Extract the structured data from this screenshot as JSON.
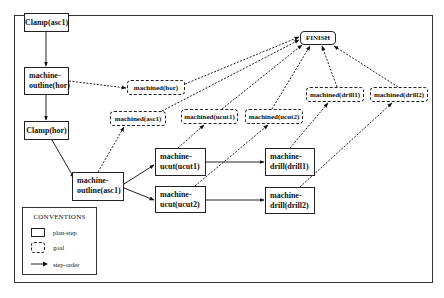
{
  "diagram": {
    "plan_steps": [
      {
        "id": "clamp_asc1",
        "label": "Clamp(asc1)"
      },
      {
        "id": "outline_hor",
        "label_line1": "machine-",
        "label_line2": "outline(hor)"
      },
      {
        "id": "clamp_hor",
        "label": "Clamp(hor)"
      },
      {
        "id": "outline_asc1",
        "label_line1": "machine-",
        "label_line2": "outline(asc1)"
      },
      {
        "id": "ucut1",
        "label_line1": "machine-",
        "label_line2": "ucut(ucut1)"
      },
      {
        "id": "ucut2",
        "label_line1": "machine-",
        "label_line2": "ucut(ucut2)"
      },
      {
        "id": "drill1",
        "label_line1": "machine-",
        "label_line2": "drill(drill1)"
      },
      {
        "id": "drill2",
        "label_line1": "machine-",
        "label_line2": "drill(drill2)"
      }
    ],
    "goals": [
      {
        "id": "g_hor",
        "label": "machined(hor)"
      },
      {
        "id": "g_asc1",
        "label": "machined(asc1)"
      },
      {
        "id": "g_ucut1",
        "label": "machined(ucut1)"
      },
      {
        "id": "g_ucut2",
        "label": "machined(ucut2)"
      },
      {
        "id": "g_drill1",
        "label": "machined(drill1)"
      },
      {
        "id": "g_drill2",
        "label": "machined(drill2)"
      }
    ],
    "finish": {
      "label": "FINISH"
    },
    "step_order_edges": [
      [
        "clamp_asc1",
        "outline_hor"
      ],
      [
        "outline_hor",
        "clamp_hor"
      ],
      [
        "clamp_hor",
        "outline_asc1"
      ],
      [
        "outline_asc1",
        "ucut1"
      ],
      [
        "outline_asc1",
        "ucut2"
      ],
      [
        "ucut1",
        "drill1"
      ],
      [
        "ucut2",
        "drill2"
      ]
    ],
    "goal_edges": [
      [
        "outline_hor",
        "g_hor"
      ],
      [
        "outline_asc1",
        "g_asc1"
      ],
      [
        "ucut1",
        "g_ucut1"
      ],
      [
        "ucut2",
        "g_ucut2"
      ],
      [
        "drill1",
        "g_drill1"
      ],
      [
        "drill2",
        "g_drill2"
      ],
      [
        "g_hor",
        "finish"
      ],
      [
        "g_asc1",
        "finish"
      ],
      [
        "g_ucut1",
        "finish"
      ],
      [
        "g_ucut2",
        "finish"
      ],
      [
        "g_drill1",
        "finish"
      ],
      [
        "g_drill2",
        "finish"
      ]
    ]
  },
  "legend": {
    "title": "CONVENTIONS",
    "items": [
      {
        "symbol": "solid-rectangle",
        "label": "plan-step"
      },
      {
        "symbol": "dashed-rounded-rectangle",
        "label": "goal"
      },
      {
        "symbol": "arrow",
        "label": "step-order"
      }
    ]
  }
}
